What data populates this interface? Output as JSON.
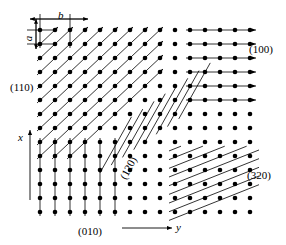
{
  "figure": {
    "type": "crystal-lattice-plane-diagram"
  },
  "axes": {
    "x": {
      "label": "x",
      "direction": "up",
      "arrow": true,
      "line": {
        "x": 30,
        "y1": 200,
        "y2": 130
      },
      "label_pos": {
        "x": 18,
        "y": 132
      }
    },
    "y": {
      "label": "y",
      "direction": "right",
      "arrow": true,
      "line": {
        "x1": 122,
        "x2": 172,
        "y": 228
      },
      "label_pos": {
        "x": 176,
        "y": 222
      }
    }
  },
  "lattice": {
    "origin": {
      "x": 40,
      "y": 30
    },
    "spacing": {
      "b": 15,
      "a": 14
    },
    "cols": 15,
    "rows": 14,
    "dot_radius": 2.3,
    "dot_color": "#000000"
  },
  "dimensions": [
    {
      "name": "b",
      "label": "b",
      "orientation": "horizontal",
      "label_pos": {
        "x": 58,
        "y": 10
      },
      "line": {
        "x1": 30,
        "x2": 88,
        "y": 19
      },
      "ticks": [
        {
          "x": 40,
          "y1": 14,
          "y2": 48
        },
        {
          "x": 70,
          "y1": 14,
          "y2": 48
        }
      ]
    },
    {
      "name": "a",
      "label": "a",
      "orientation": "vertical",
      "label_pos": {
        "x": 26,
        "y": 33
      },
      "line": {
        "x": 36,
        "y1": 19,
        "y2": 49
      },
      "ticks": [
        {
          "y": 30,
          "x1": 27,
          "x2": 56
        },
        {
          "y": 44,
          "x1": 27,
          "x2": 56
        }
      ]
    }
  ],
  "planes": [
    {
      "index": "(110)",
      "label": "(110)",
      "label_pos": {
        "x": 10,
        "y": 82
      },
      "style": "diagonal-45-up-right",
      "arrowheads": true,
      "stroke_width": 0.8,
      "description": "45 degree diagonal family in upper-left quadrant"
    },
    {
      "index": "(100)",
      "label": "(100)",
      "label_pos": {
        "x": 249,
        "y": 44
      },
      "style": "horizontal",
      "arrowheads": true,
      "stroke_width": 0.8,
      "description": "horizontal line family in upper-right quadrant"
    },
    {
      "index": "(010)",
      "label": "(010)",
      "label_pos": {
        "x": 78,
        "y": 226
      },
      "style": "vertical",
      "arrowheads": false,
      "stroke_width": 0.8,
      "description": "vertical line family in lower-left quadrant"
    },
    {
      "index": "(120)",
      "label": "(120)",
      "label_pos": {
        "x": 118,
        "y": 176
      },
      "label_rotation": -62,
      "style": "steep-diagonal-up-right",
      "arrowheads": false,
      "stroke_width": 0.8,
      "description": "steep diagonal family, slope 2 rows per column, centre of figure"
    },
    {
      "index": "(320)",
      "label": "(320)",
      "label_pos": {
        "x": 247,
        "y": 170
      },
      "style": "shallow-dense-hatch",
      "arrowheads": false,
      "stroke_width": 0.8,
      "description": "dense shallow hatch family in lower-right quadrant"
    }
  ],
  "colors": {
    "ink": "#000000",
    "background": "#ffffff"
  }
}
